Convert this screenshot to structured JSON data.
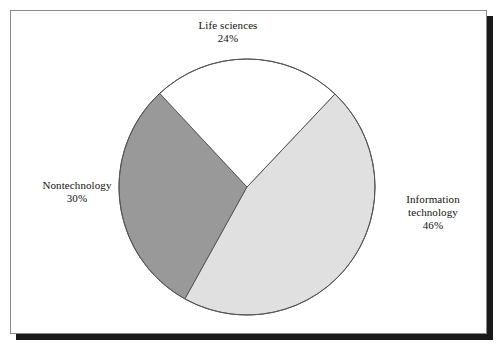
{
  "figure": {
    "background_color": "#ffffff",
    "frame_border_color": "#8a8a8a",
    "frame_shadow_color": "#1a1a1a",
    "text_color": "#111111"
  },
  "chart_data": {
    "type": "pie",
    "title": "",
    "subtitle": "",
    "xlabel": "",
    "ylabel": "",
    "grid": false,
    "legend_position": "none",
    "labels_position": "outside",
    "units": "percent",
    "total": 100,
    "categories": [
      "Life sciences",
      "Information technology",
      "Nontechnology"
    ],
    "values": [
      24,
      46,
      30
    ],
    "value_labels": [
      "24%",
      "46%",
      "30%"
    ],
    "colors": [
      "#ffffff",
      "#e0e0e0",
      "#999999"
    ],
    "slice_outline_color": "#555555",
    "start_angle_deg": -43,
    "direction": "clockwise",
    "slices": [
      {
        "name": "Life sciences",
        "value": 24,
        "value_label": "24%",
        "color": "#ffffff",
        "start_angle_deg": -43,
        "end_angle_deg": 43.4,
        "label_lines": [
          "Life sciences",
          "24%"
        ]
      },
      {
        "name": "Information technology",
        "value": 46,
        "value_label": "46%",
        "color": "#e0e0e0",
        "start_angle_deg": 43.4,
        "end_angle_deg": 209,
        "label_lines": [
          "Information",
          "technology",
          "46%"
        ]
      },
      {
        "name": "Nontechnology",
        "value": 30,
        "value_label": "30%",
        "color": "#999999",
        "start_angle_deg": 209,
        "end_angle_deg": 317,
        "label_lines": [
          "Nontechnology",
          "30%"
        ]
      }
    ],
    "geometry": {
      "center_x": 236,
      "center_y": 176,
      "radius": 128
    }
  },
  "labels": {
    "life_sciences": {
      "name": "Life sciences",
      "value": "24%"
    },
    "nontechnology": {
      "name": "Nontechnology",
      "value": "30%"
    },
    "information_technology": {
      "name_line1": "Information",
      "name_line2": "technology",
      "value": "46%"
    }
  }
}
